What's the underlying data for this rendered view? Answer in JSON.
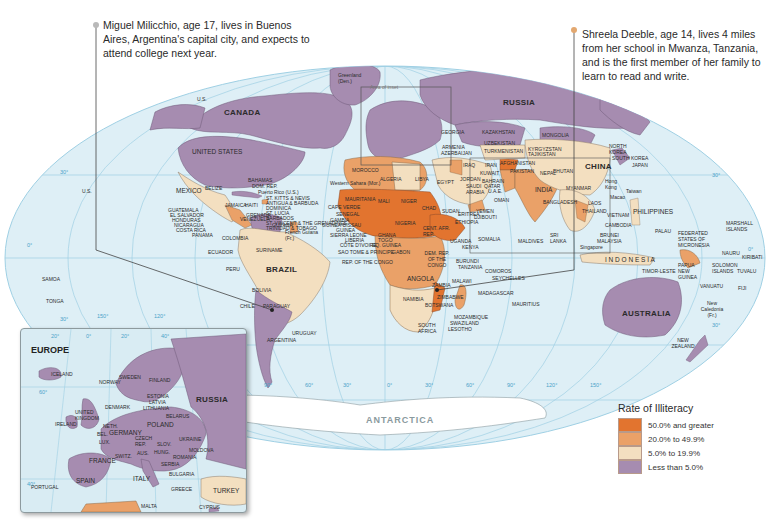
{
  "title": "Rate of Illiteracy",
  "callouts": {
    "miguel": "Miguel Milicchio, age 17, lives in Buenos Aires, Argentina's capital city, and expects to attend college next year.",
    "shreela": "Shreela Deeble, age 14, lives 4 miles from her school in Mwanza, Tanzania, and is the first member of her family to learn to read and write."
  },
  "legend": {
    "title": "Rate of Illiteracy",
    "items": [
      {
        "label": "50.0% and greater",
        "color": "#e2742f"
      },
      {
        "label": "20.0% to 49.9%",
        "color": "#eaa168"
      },
      {
        "label": "5.0% to 19.9%",
        "color": "#f3dfc0"
      },
      {
        "label": "Less than 5.0%",
        "color": "#a68cb0"
      }
    ]
  },
  "colors": {
    "ocean": "#deeff6",
    "graticule": "#9fd0e4",
    "high": "#e2742f",
    "mid_high": "#eaa168",
    "low": "#f3dfc0",
    "lowest": "#a68cb0",
    "antarctica": "#ffffff"
  },
  "inset": {
    "title": "EUROPE",
    "area_label": "Area of inset",
    "labels": {
      "iceland": "ICELAND",
      "ireland": "IRELAND",
      "uk": "UNITED KINGDOM",
      "norway": "NORWAY",
      "sweden": "SWEDEN",
      "finland": "FINLAND",
      "denmark": "DENMARK",
      "estonia": "ESTONIA",
      "latvia": "LATVIA",
      "lithuania": "LITHUANIA",
      "neth": "NETH.",
      "bel": "BEL.",
      "lux": "LUX.",
      "germany": "GERMANY",
      "poland": "POLAND",
      "belarus": "BELARUS",
      "czech": "CZECH REP.",
      "slov": "SLOV.",
      "aus": "AUS.",
      "hung": "HUNG.",
      "switz": "SWITZ.",
      "ukraine": "UKRAINE",
      "moldova": "MOLDOVA",
      "romania": "ROMANIA",
      "france": "FRANCE",
      "serbia": "SERBIA",
      "bulgaria": "BULGARIA",
      "italy": "ITALY",
      "greece": "GREECE",
      "spain": "SPAIN",
      "portugal": "PORTUGAL",
      "russia": "RUSSIA",
      "turkey": "TURKEY",
      "malta": "MALTA",
      "cyprus": "CYPRUS",
      "lat60": "60°",
      "lat40": "40°",
      "lon20w": "20°",
      "lon0": "0°",
      "lon20e": "20°",
      "lon40e": "40°"
    }
  },
  "map_labels": {
    "canada": "CANADA",
    "us": "UNITED STATES",
    "us_alaska": "U.S.",
    "us_hawaii": "U.S.",
    "greenland": "Greenland (Den.)",
    "russia": "RUSSIA",
    "mexico": "MEXICO",
    "belize": "BELIZE",
    "bahamas": "BAHAMAS",
    "dom_rep": "DOM. REP.",
    "puerto_rico": "Puerto Rico (U.S.)",
    "st_kitts": "ST. KITTS & NEVIS",
    "antigua": "ANTIGUA & BARBUDA",
    "dominica": "DOMINICA",
    "st_lucia": "ST. LUCIA",
    "barbados": "BARBADOS",
    "st_vincent": "ST. VINCENT & THE GRENADINES",
    "trinidad": "TRINIDAD & TOBAGO",
    "grenada": "GRENADA",
    "jamaica": "JAMAICA",
    "haiti": "HAITI",
    "cuba": "CUBA",
    "guatemala": "GUATEMALA",
    "el_salvador": "EL SALVADOR",
    "honduras": "HONDURAS",
    "nicaragua": "NICARAGUA",
    "costa_rica": "COSTA RICA",
    "panama": "PANAMA",
    "venezuela": "VENEZUELA",
    "guyana": "GUYANA",
    "french_guiana": "French Guiana (Fr.)",
    "suriname": "SURINAME",
    "colombia": "COLOMBIA",
    "ecuador": "ECUADOR",
    "peru": "PERU",
    "brazil": "BRAZIL",
    "bolivia": "BOLIVIA",
    "chile": "CHILE",
    "paraguay": "PARAGUAY",
    "uruguay": "URUGUAY",
    "argentina": "ARGENTINA",
    "morocco": "MOROCCO",
    "western_sahara": "Western Sahara (Mor.)",
    "algeria": "ALGERIA",
    "libya": "LIBYA",
    "egypt": "EGYPT",
    "mauritania": "MAURITANIA",
    "mali": "MALI",
    "niger": "NIGER",
    "chad": "CHAD",
    "sudan": "SUDAN",
    "cape_verde": "CAPE VERDE",
    "senegal": "SENEGAL",
    "gambia": "GAMBIA",
    "guinea_bissau": "GUINEA-BISSAU",
    "guinea": "GUINEA",
    "sierra_leone": "SIERRA LEONE",
    "liberia": "LIBERIA",
    "cote_divoire": "CÔTE D'IVOIRE",
    "ghana": "GHANA",
    "togo": "TOGO",
    "benin": "BENIN",
    "nigeria": "NIGERIA",
    "eq_guinea": "EQ. GUINEA",
    "sao_tome": "SAO TOME & PRINCIPE",
    "gabon": "GABON",
    "rep_congo": "REP. OF THE CONGO",
    "car": "CENT. AFR. REP.",
    "cameroon": "CAMEROON",
    "eritrea": "ERITREA",
    "djibouti": "DJIBOUTI",
    "ethiopia": "ETHIOPIA",
    "somalia": "SOMALIA",
    "uganda": "UGANDA",
    "kenya": "KENYA",
    "rwanda": "RWANDA",
    "burundi": "BURUNDI",
    "tanzania": "TANZANIA",
    "drc": "DEM. REP. OF THE CONGO",
    "angola": "ANGOLA",
    "zambia": "ZAMBIA",
    "malawi": "MALAWI",
    "zimbabwe": "ZIMBABWE",
    "namibia": "NAMIBIA",
    "botswana": "BOTSWANA",
    "mozambique": "MOZAMBIQUE",
    "swaziland": "SWAZILAND",
    "lesotho": "LESOTHO",
    "south_africa": "SOUTH AFRICA",
    "madagascar": "MADAGASCAR",
    "comoros": "COMOROS",
    "seychelles": "SEYCHELLES",
    "mauritius": "MAURITIUS",
    "georgia": "GEORGIA",
    "armenia": "ARMENIA",
    "azerbaijan": "AZERBAIJAN",
    "kazakhstan": "KAZAKHSTAN",
    "uzbekistan": "UZBEKISTAN",
    "turkmenistan": "TURKMENISTAN",
    "kyrgyzstan": "KYRGYZSTAN",
    "tajikistan": "TAJIKISTAN",
    "mongolia": "MONGOLIA",
    "syria": "SYRIA",
    "lebanon": "LEBANON",
    "israel": "ISRAEL",
    "jordan": "JORDAN",
    "iraq": "IRAQ",
    "iran": "IRAN",
    "kuwait": "KUWAIT",
    "bahrain": "BAHRAIN",
    "qatar": "QATAR",
    "uae": "U.A.E.",
    "saudi_arabia": "SAUDI ARABIA",
    "oman": "OMAN",
    "yemen": "YEMEN",
    "afghanistan": "AFGHANISTAN",
    "pakistan": "PAKISTAN",
    "india": "INDIA",
    "nepal": "NEPAL",
    "bhutan": "BHUTAN",
    "bangladesh": "BANGLADESH",
    "sri_lanka": "SRI LANKA",
    "maldives": "MALDIVES",
    "china": "CHINA",
    "north_korea": "NORTH KOREA",
    "south_korea": "SOUTH KOREA",
    "japan": "JAPAN",
    "hong_kong": "Hong Kong",
    "macao": "Macao",
    "taiwan": "Taiwan",
    "myanmar": "MYANMAR",
    "laos": "LAOS",
    "thailand": "THAILAND",
    "vietnam": "VIETNAM",
    "cambodia": "CAMBODIA",
    "philippines": "PHILIPPINES",
    "malaysia": "MALAYSIA",
    "brunei": "BRUNEI",
    "singapore": "Singapore",
    "indonesia": "I N D O N E S I A",
    "timor_leste": "TIMOR-LESTE",
    "papua_new_guinea": "PAPUA NEW GUINEA",
    "palau": "PALAU",
    "micronesia": "FEDERATED STATES OF MICRONESIA",
    "marshall_islands": "MARSHALL ISLANDS",
    "nauru": "NAURU",
    "kiribati": "KIRIBATI",
    "solomon_islands": "SOLOMON ISLANDS",
    "tuvalu": "TUVALU",
    "vanuatu": "VANUATU",
    "fiji": "FIJI",
    "new_caledonia": "New Caledonia (Fr.)",
    "australia": "AUSTRALIA",
    "new_zealand": "NEW ZEALAND",
    "samoa": "SAMOA",
    "tonga": "TONGA",
    "antarctica": "ANTARCTICA"
  },
  "graticule_labels": {
    "lat_30n_left": "30°",
    "lat_0_left": "0°",
    "lat_30s_left": "30°",
    "lat_30n_right": "30°",
    "lat_0_right": "0°",
    "lat_30s_right": "30°",
    "lon_150w": "150°",
    "lon_120w": "120°",
    "lon_90w": "90°",
    "lon_60w": "60°",
    "lon_30w": "30°",
    "lon_0": "0°",
    "lon_30e": "30°",
    "lon_60e": "60°",
    "lon_90e": "90°",
    "lon_120e": "120°",
    "lon_150e": "150°"
  }
}
